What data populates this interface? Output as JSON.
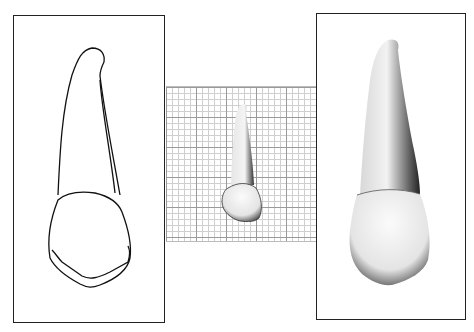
{
  "figure": {
    "panels": [
      {
        "id": "outline-drawing",
        "type": "line-drawing",
        "label": ""
      },
      {
        "id": "grid-photo",
        "type": "photo-on-grid",
        "label": ""
      },
      {
        "id": "shaded-rendering",
        "type": "shaded-illustration",
        "label": ""
      }
    ]
  },
  "colors": {
    "line": "#111111",
    "grid_major": "#9a9a9a",
    "grid_minor": "#cfcfcf",
    "background": "#ffffff"
  }
}
